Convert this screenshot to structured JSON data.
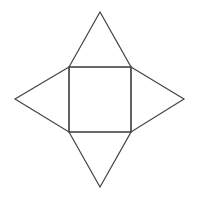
{
  "diagram": {
    "kind": "square-pyramid-net",
    "stroke_color": "#444444",
    "stroke_width": 1.2,
    "background": "#ffffff",
    "base_square": {
      "x": 69,
      "y": 67,
      "width": 62,
      "height": 65
    },
    "triangles": [
      {
        "name": "top",
        "points": "69,67 100,12 131,67"
      },
      {
        "name": "left",
        "points": "69,67 15,99 69,132"
      },
      {
        "name": "right",
        "points": "131,67 184,99 131,132"
      },
      {
        "name": "bottom",
        "points": "69,132 100,187 131,132"
      }
    ]
  }
}
